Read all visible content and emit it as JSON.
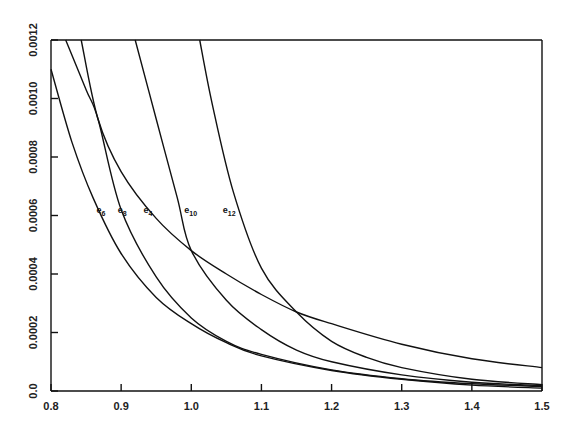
{
  "chart_data": {
    "type": "line",
    "title": "",
    "xlabel": "",
    "ylabel": "",
    "xlim": [
      0.8,
      1.5
    ],
    "ylim": [
      0.0,
      0.0012
    ],
    "grid": false,
    "legend": "inline labels",
    "x_ticks": [
      "0.8",
      "0.9",
      "1.0",
      "1.1",
      "1.2",
      "1.3",
      "1.4",
      "1.5"
    ],
    "y_ticks": [
      "0.0",
      "0.0002",
      "0.0004",
      "0.0006",
      "0.0008",
      "0.0010",
      "0.0012"
    ],
    "series": [
      {
        "name": "e6",
        "label_base": "e",
        "label_sub": "6",
        "label_pos": [
          0.865,
          0.00061
        ],
        "x": [
          0.8,
          0.83,
          0.86,
          0.9,
          0.95,
          1.0,
          1.05,
          1.1,
          1.2,
          1.3,
          1.4,
          1.5
        ],
        "y": [
          0.0011,
          0.00085,
          0.00066,
          0.00047,
          0.00032,
          0.00023,
          0.000165,
          0.00012,
          7e-05,
          4e-05,
          2e-05,
          1e-05
        ]
      },
      {
        "name": "e8",
        "label_base": "e",
        "label_sub": "8",
        "label_pos": [
          0.895,
          0.00061
        ],
        "x": [
          0.821,
          0.85,
          0.867,
          0.9,
          0.95,
          1.0,
          1.05,
          1.1,
          1.2,
          1.3,
          1.4,
          1.5
        ],
        "y": [
          0.0012,
          0.00103,
          0.00093,
          0.00062,
          0.00039,
          0.00025,
          0.00017,
          0.000125,
          7.2e-05,
          4.2e-05,
          2.5e-05,
          1.5e-05
        ]
      },
      {
        "name": "e4",
        "label_base": "e",
        "label_sub": "4",
        "label_pos": [
          0.932,
          0.00061
        ],
        "x": [
          0.843,
          0.867,
          0.9,
          0.95,
          1.0,
          1.05,
          1.1,
          1.15,
          1.2,
          1.3,
          1.4,
          1.5
        ],
        "y": [
          0.0012,
          0.00093,
          0.00075,
          0.00059,
          0.00048,
          0.0004,
          0.00033,
          0.00027,
          0.00023,
          0.00016,
          0.00011,
          8e-05
        ]
      },
      {
        "name": "e10",
        "label_base": "e",
        "label_sub": "10",
        "label_pos": [
          0.99,
          0.00061
        ],
        "x": [
          0.92,
          0.95,
          0.98,
          1.0,
          1.05,
          1.1,
          1.15,
          1.2,
          1.3,
          1.4,
          1.5
        ],
        "y": [
          0.0012,
          0.00093,
          0.00066,
          0.00048,
          0.00031,
          0.00021,
          0.00014,
          0.0001,
          5.5e-05,
          3e-05,
          1.8e-05
        ]
      },
      {
        "name": "e12",
        "label_base": "e",
        "label_sub": "12",
        "label_pos": [
          1.045,
          0.00061
        ],
        "x": [
          1.012,
          1.03,
          1.06,
          1.1,
          1.15,
          1.2,
          1.25,
          1.3,
          1.4,
          1.5
        ],
        "y": [
          0.0012,
          0.00098,
          0.00068,
          0.00042,
          0.00027,
          0.00017,
          0.000115,
          8e-05,
          4e-05,
          2.2e-05
        ]
      }
    ]
  }
}
